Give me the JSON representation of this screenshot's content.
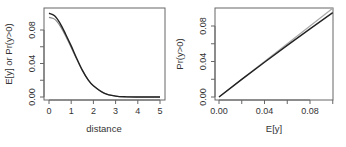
{
  "chart_data": [
    {
      "type": "line",
      "title": "",
      "xlabel": "distance",
      "ylabel": "E[y] or Pr(y>0)",
      "xlim": [
        0,
        5
      ],
      "ylim": [
        0,
        0.1
      ],
      "x_ticks": [
        "0",
        "1",
        "2",
        "3",
        "4",
        "5"
      ],
      "y_ticks": [
        "0.00",
        "0.04",
        "0.08"
      ],
      "grid": false,
      "x": [
        0,
        0.25,
        0.5,
        0.75,
        1.0,
        1.25,
        1.5,
        1.75,
        2.0,
        2.5,
        3.0,
        3.5,
        4.0,
        4.5,
        5.0
      ],
      "series": [
        {
          "name": "E[y]",
          "color": "#222222",
          "values": [
            0.1,
            0.097,
            0.088,
            0.075,
            0.061,
            0.046,
            0.032,
            0.021,
            0.0135,
            0.0044,
            0.0011,
            0.0002,
            0.0,
            0.0,
            0.0
          ]
        },
        {
          "name": "Pr(y>0)",
          "color": "#888888",
          "values": [
            0.095,
            0.093,
            0.085,
            0.073,
            0.059,
            0.045,
            0.032,
            0.021,
            0.0133,
            0.0044,
            0.0011,
            0.0002,
            0.0,
            0.0,
            0.0
          ]
        }
      ]
    },
    {
      "type": "line",
      "title": "",
      "xlabel": "E[y]",
      "ylabel": "Pr(y>0)",
      "xlim": [
        0,
        0.1
      ],
      "ylim": [
        0,
        0.1
      ],
      "x_ticks": [
        "0.00",
        "0.04",
        "0.08"
      ],
      "y_ticks": [
        "0.00",
        "0.04",
        "0.08"
      ],
      "grid": false,
      "x": [
        0,
        0.02,
        0.04,
        0.06,
        0.08,
        0.1
      ],
      "series": [
        {
          "name": "Pr(y>0) vs E[y]",
          "color": "#222222",
          "values": [
            0,
            0.0198,
            0.0392,
            0.0582,
            0.0768,
            0.095
          ]
        },
        {
          "name": "reference y=x",
          "color": "#aaaaaa",
          "values": [
            0,
            0.02,
            0.04,
            0.06,
            0.08,
            0.1
          ]
        }
      ]
    }
  ]
}
